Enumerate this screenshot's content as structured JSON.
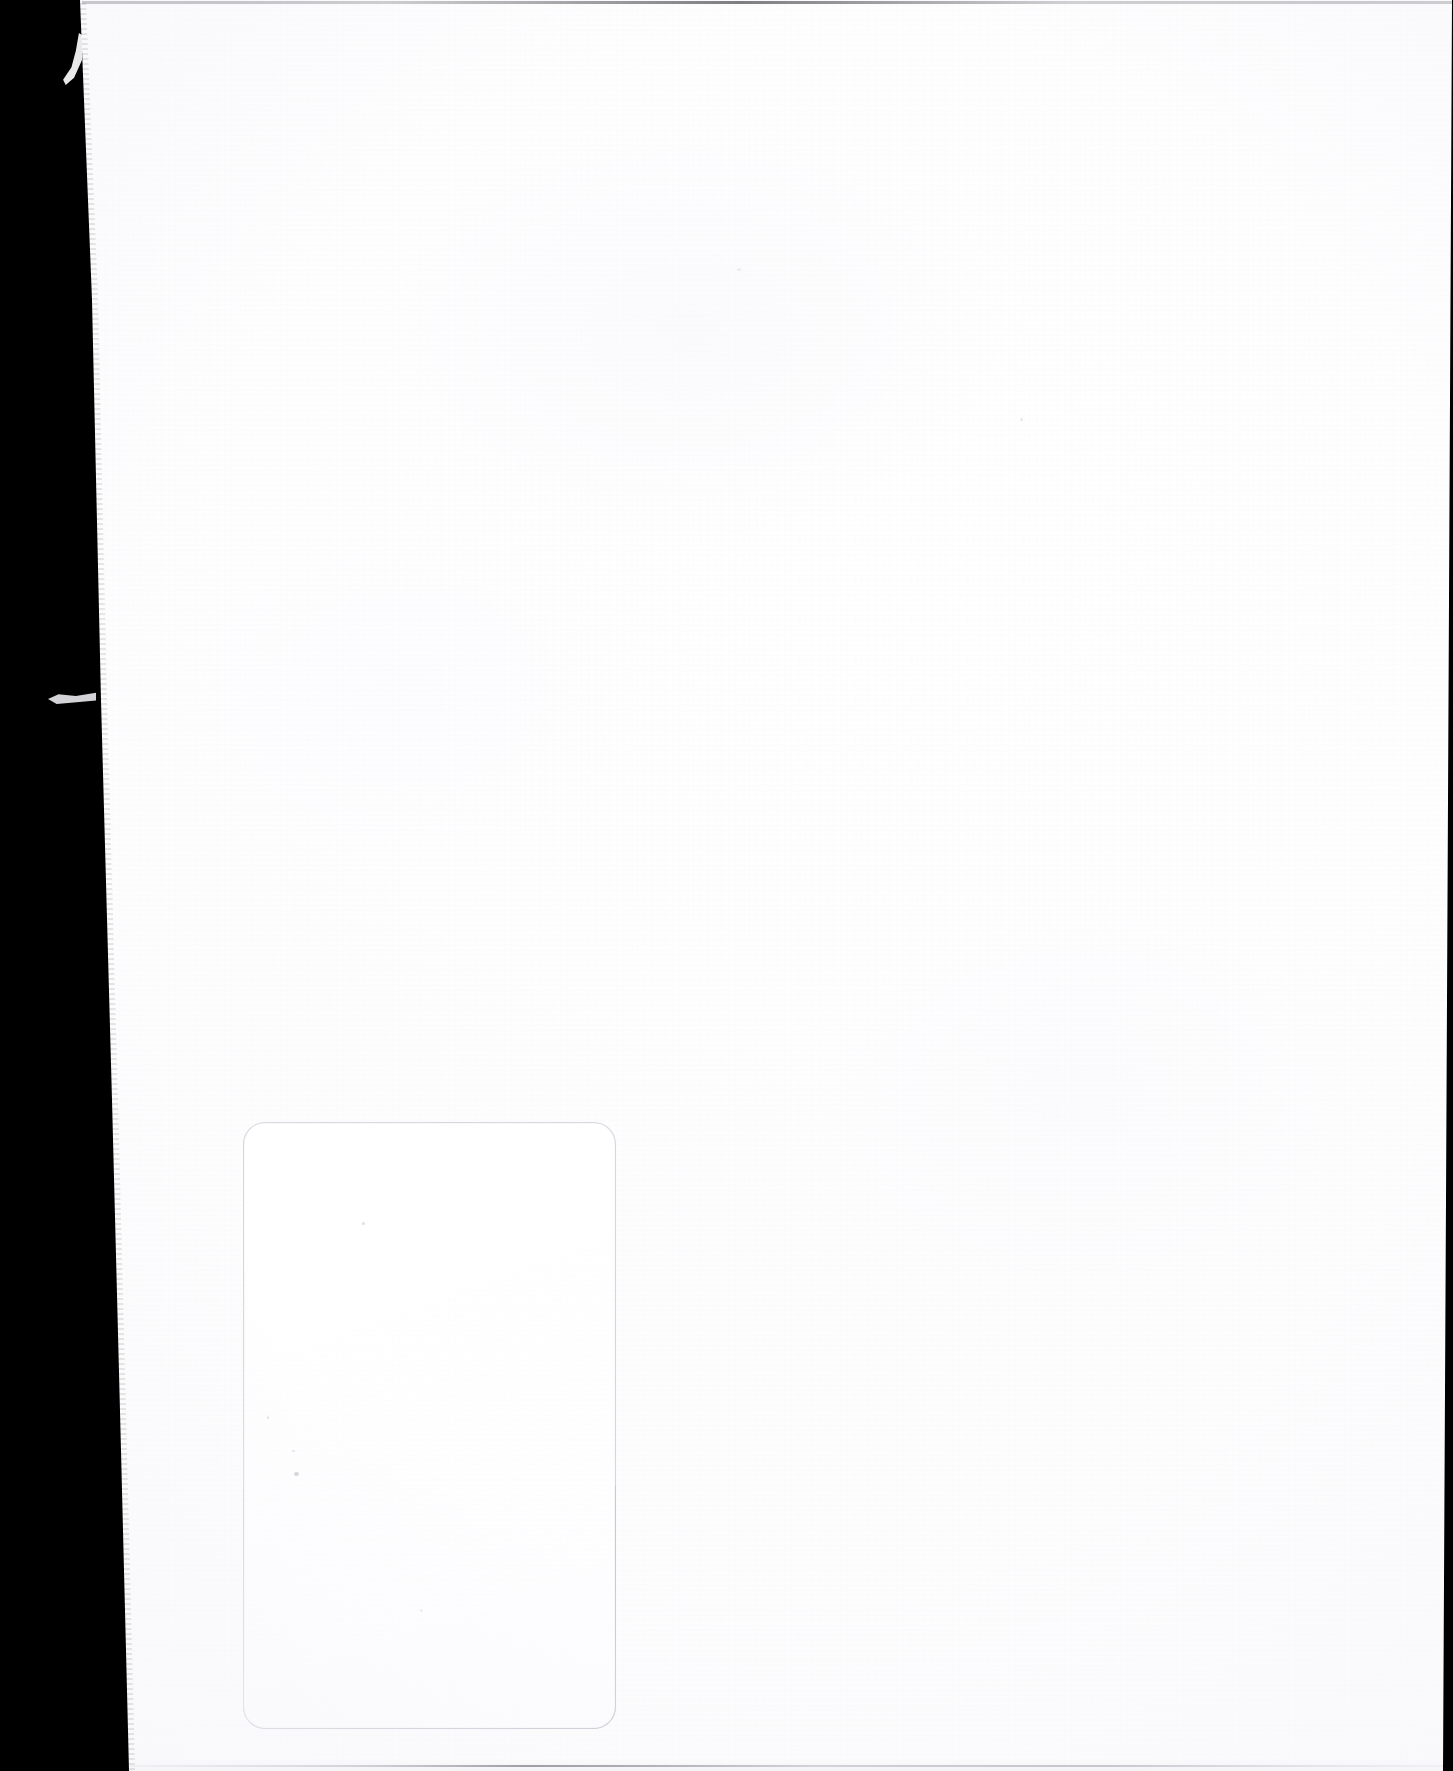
{
  "document": {
    "kind": "scanned-page",
    "page_state": "blank",
    "visible_text": "",
    "width_px": 1453,
    "height_px": 1771,
    "background_color": "#ffffff"
  },
  "scan_artifacts": {
    "left_edge_band": {
      "name": "scanner-bed-black-band",
      "color": "#000000",
      "position": "left",
      "width_top_px": 80,
      "width_bottom_px": 129,
      "description": "black scanner background visible beside the paper edge"
    },
    "right_edge_band": {
      "name": "scanner-bed-dark-strip",
      "color": "#000000",
      "position": "right",
      "width_top_px": 2,
      "width_bottom_px": 11
    },
    "paper_fiber_wisps": [
      {
        "name": "fiber-wisp-upper",
        "x": 60,
        "y": 33,
        "color": "#f4f4f6"
      },
      {
        "name": "fiber-wisp-lower",
        "x": 48,
        "y": 692,
        "color": "#e9e9ee"
      }
    ],
    "page_edge_lines": [
      {
        "name": "top-edge-hairline",
        "y": 1,
        "color": "#3c3c44"
      },
      {
        "name": "bottom-edge-hairline",
        "y": 1765,
        "color": "#787884"
      }
    ],
    "specks": [
      {
        "x": 362,
        "y": 1222
      },
      {
        "x": 267,
        "y": 1416
      },
      {
        "x": 292,
        "y": 1450
      },
      {
        "x": 294,
        "y": 1472
      },
      {
        "x": 1020,
        "y": 418
      },
      {
        "x": 737,
        "y": 268
      },
      {
        "x": 420,
        "y": 1609
      }
    ]
  },
  "impression": {
    "name": "faint-rounded-rectangle-impression",
    "label": "",
    "outline_color": "#d4d4dc",
    "fill_color": "#ffffff",
    "x": 243,
    "y": 1122,
    "width": 371,
    "height": 605,
    "corner_radius": 22,
    "description": "very faint light-gray rounded rectangle outline in the lower-left quadrant of the page"
  }
}
